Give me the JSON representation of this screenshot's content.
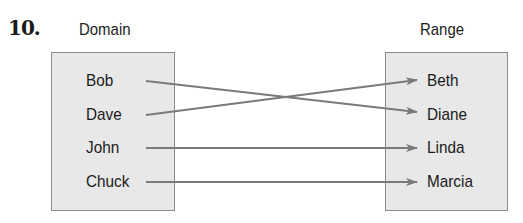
{
  "problem_number": "10.",
  "domain": {
    "title": "Domain",
    "items": [
      "Bob",
      "Dave",
      "John",
      "Chuck"
    ]
  },
  "range": {
    "title": "Range",
    "items": [
      "Beth",
      "Diane",
      "Linda",
      "Marcia"
    ]
  },
  "mappings": [
    {
      "from": "Bob",
      "to": "Diane"
    },
    {
      "from": "Dave",
      "to": "Beth"
    },
    {
      "from": "John",
      "to": "Linda"
    },
    {
      "from": "Chuck",
      "to": "Marcia"
    }
  ],
  "colors": {
    "box_fill": "#e8e8e8",
    "box_border": "#8c8c8c",
    "arrow": "#7a7a7a",
    "text": "#1a1a1a"
  }
}
